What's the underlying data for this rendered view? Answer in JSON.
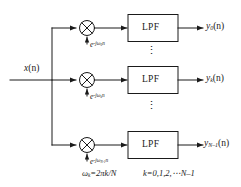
{
  "diagram": {
    "stroke_color": "#1a1a1a",
    "text_color": "#1a1a1a",
    "background": "#ffffff",
    "input": {
      "label_base": "x",
      "label_arg": "(n)"
    },
    "branches": [
      {
        "id": "branch-0",
        "multiplier_symbol": "x-in-circle",
        "filter_label": "LPF",
        "exponent_base": "e",
        "exponent_sup_prefix": "-j",
        "exponent_sup_omega": "ω",
        "exponent_sup_sub": "0",
        "exponent_sup_suffix": "n",
        "output_base": "y",
        "output_sub": "0",
        "output_arg": "(n)"
      },
      {
        "id": "branch-k",
        "multiplier_symbol": "x-in-circle",
        "filter_label": "LPF",
        "exponent_base": "e",
        "exponent_sup_prefix": "-j",
        "exponent_sup_omega": "ω",
        "exponent_sup_sub": "k",
        "exponent_sup_suffix": "n",
        "output_base": "y",
        "output_sub": "k",
        "output_arg": "(n)"
      },
      {
        "id": "branch-n-1",
        "multiplier_symbol": "x-in-circle",
        "filter_label": "LPF",
        "exponent_base": "e",
        "exponent_sup_prefix": "-j",
        "exponent_sup_omega": "ω",
        "exponent_sup_sub": "N-1",
        "exponent_sup_suffix": "n",
        "output_base": "y",
        "output_sub": "N–1",
        "output_arg": "(n)"
      }
    ],
    "ellipsis": {
      "glyph": "⋮",
      "count": 2
    },
    "caption": {
      "omega_formula_lhs_base": "ω",
      "omega_formula_lhs_sub": "k",
      "omega_formula_rhs": "=2πk/N",
      "index_formula": "k=0,1,2,⋯N–1"
    }
  }
}
